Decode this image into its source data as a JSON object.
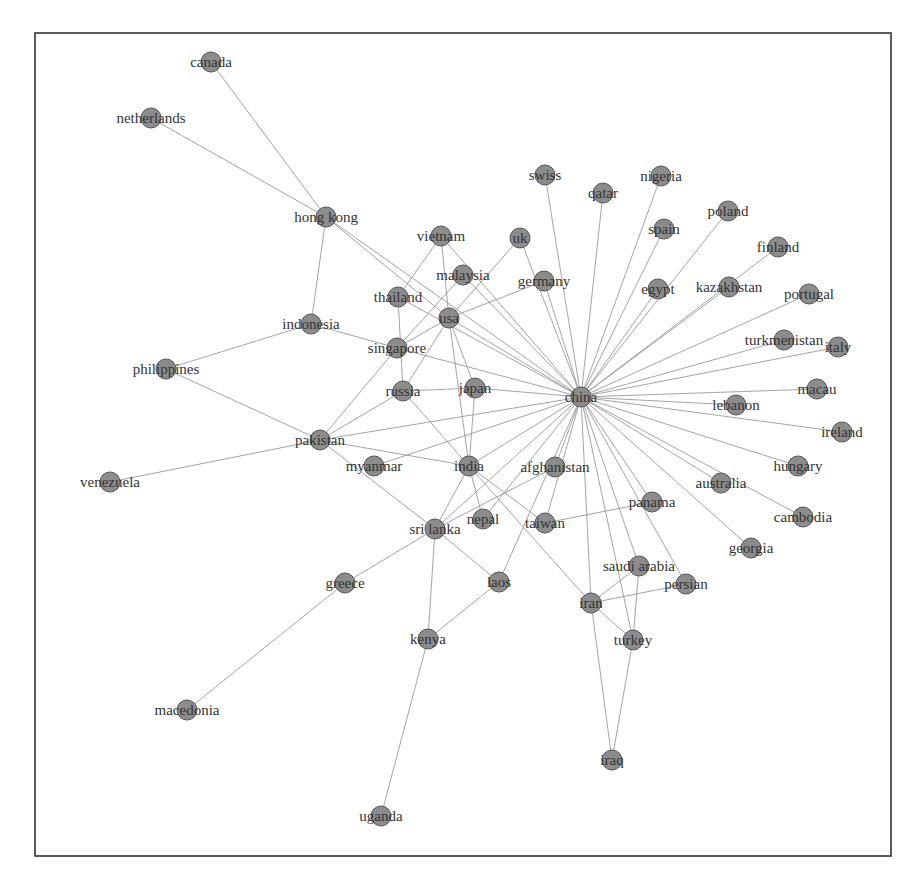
{
  "figure": {
    "type": "network-graph",
    "frame": {
      "x": 35,
      "y": 33,
      "width": 856,
      "height": 823
    },
    "colors": {
      "node_fill": "#8c8c8c",
      "node_stroke": "#555555",
      "edge": "#9a9a9a",
      "label": "#333333",
      "frame": "#333333"
    },
    "node_radius": 10
  },
  "nodes": [
    {
      "id": "canada",
      "label": "canada",
      "x": 211,
      "y": 62
    },
    {
      "id": "netherlands",
      "label": "netherlands",
      "x": 151,
      "y": 118
    },
    {
      "id": "hong_kong",
      "label": "hong kong",
      "x": 326,
      "y": 217
    },
    {
      "id": "vietnam",
      "label": "vietnam",
      "x": 441,
      "y": 236
    },
    {
      "id": "uk",
      "label": "uk",
      "x": 520,
      "y": 238
    },
    {
      "id": "swiss",
      "label": "swiss",
      "x": 545,
      "y": 175
    },
    {
      "id": "qatar",
      "label": "qatar",
      "x": 603,
      "y": 193
    },
    {
      "id": "nigeria",
      "label": "nigeria",
      "x": 661,
      "y": 176
    },
    {
      "id": "spain",
      "label": "spain",
      "x": 664,
      "y": 229
    },
    {
      "id": "poland",
      "label": "poland",
      "x": 728,
      "y": 211
    },
    {
      "id": "finland",
      "label": "finland",
      "x": 778,
      "y": 247
    },
    {
      "id": "egypt",
      "label": "egypt",
      "x": 658,
      "y": 289
    },
    {
      "id": "kazakhstan",
      "label": "kazakhstan",
      "x": 729,
      "y": 287
    },
    {
      "id": "portugal",
      "label": "portugal",
      "x": 809,
      "y": 294
    },
    {
      "id": "malaysia",
      "label": "malaysia",
      "x": 463,
      "y": 275
    },
    {
      "id": "germany",
      "label": "germany",
      "x": 544,
      "y": 281
    },
    {
      "id": "thailand",
      "label": "thailand",
      "x": 398,
      "y": 297
    },
    {
      "id": "usa",
      "label": "usa",
      "x": 449,
      "y": 318
    },
    {
      "id": "indonesia",
      "label": "indonesia",
      "x": 311,
      "y": 324
    },
    {
      "id": "singapore",
      "label": "singapore",
      "x": 397,
      "y": 348
    },
    {
      "id": "turkmenistan",
      "label": "turkmenistan",
      "x": 784,
      "y": 340
    },
    {
      "id": "italy",
      "label": "italy",
      "x": 838,
      "y": 347
    },
    {
      "id": "philippines",
      "label": "philippines",
      "x": 166,
      "y": 369
    },
    {
      "id": "russia",
      "label": "russia",
      "x": 403,
      "y": 391
    },
    {
      "id": "japan",
      "label": "japan",
      "x": 475,
      "y": 388
    },
    {
      "id": "china",
      "label": "china",
      "x": 581,
      "y": 397
    },
    {
      "id": "macau",
      "label": "macau",
      "x": 817,
      "y": 389
    },
    {
      "id": "lebanon",
      "label": "lebanon",
      "x": 736,
      "y": 405
    },
    {
      "id": "ireland",
      "label": "ireland",
      "x": 842,
      "y": 432
    },
    {
      "id": "pakistan",
      "label": "pakistan",
      "x": 320,
      "y": 440
    },
    {
      "id": "myanmar",
      "label": "myanmar",
      "x": 374,
      "y": 466
    },
    {
      "id": "india",
      "label": "india",
      "x": 469,
      "y": 466
    },
    {
      "id": "afghanistan",
      "label": "afghanistan",
      "x": 555,
      "y": 467
    },
    {
      "id": "hungary",
      "label": "hungary",
      "x": 798,
      "y": 466
    },
    {
      "id": "australia",
      "label": "australia",
      "x": 721,
      "y": 483
    },
    {
      "id": "panama",
      "label": "panama",
      "x": 652,
      "y": 502
    },
    {
      "id": "venezuela",
      "label": "venezuela",
      "x": 110,
      "y": 482
    },
    {
      "id": "cambodia",
      "label": "cambodia",
      "x": 803,
      "y": 517
    },
    {
      "id": "nepal",
      "label": "nepal",
      "x": 483,
      "y": 519
    },
    {
      "id": "taiwan",
      "label": "taiwan",
      "x": 545,
      "y": 523
    },
    {
      "id": "sri_lanka",
      "label": "sri lanka",
      "x": 435,
      "y": 529
    },
    {
      "id": "georgia",
      "label": "georgia",
      "x": 751,
      "y": 548
    },
    {
      "id": "saudi_arabia",
      "label": "saudi arabia",
      "x": 639,
      "y": 566
    },
    {
      "id": "persian",
      "label": "persian",
      "x": 686,
      "y": 584
    },
    {
      "id": "greece",
      "label": "greece",
      "x": 345,
      "y": 583
    },
    {
      "id": "laos",
      "label": "laos",
      "x": 499,
      "y": 582
    },
    {
      "id": "iran",
      "label": "iran",
      "x": 591,
      "y": 603
    },
    {
      "id": "kenya",
      "label": "kenya",
      "x": 428,
      "y": 639
    },
    {
      "id": "turkey",
      "label": "turkey",
      "x": 633,
      "y": 640
    },
    {
      "id": "macedonia",
      "label": "macedonia",
      "x": 187,
      "y": 710
    },
    {
      "id": "iraq",
      "label": "iraq",
      "x": 612,
      "y": 760
    },
    {
      "id": "uganda",
      "label": "uganda",
      "x": 381,
      "y": 816
    }
  ],
  "edges": [
    [
      "canada",
      "hong_kong"
    ],
    [
      "netherlands",
      "hong_kong"
    ],
    [
      "hong_kong",
      "indonesia"
    ],
    [
      "hong_kong",
      "usa"
    ],
    [
      "hong_kong",
      "china"
    ],
    [
      "indonesia",
      "singapore"
    ],
    [
      "indonesia",
      "philippines"
    ],
    [
      "philippines",
      "pakistan"
    ],
    [
      "venezuela",
      "pakistan"
    ],
    [
      "vietnam",
      "thailand"
    ],
    [
      "vietnam",
      "usa"
    ],
    [
      "vietnam",
      "china"
    ],
    [
      "malaysia",
      "singapore"
    ],
    [
      "malaysia",
      "china"
    ],
    [
      "uk",
      "usa"
    ],
    [
      "uk",
      "china"
    ],
    [
      "germany",
      "usa"
    ],
    [
      "germany",
      "china"
    ],
    [
      "swiss",
      "china"
    ],
    [
      "qatar",
      "china"
    ],
    [
      "nigeria",
      "china"
    ],
    [
      "spain",
      "china"
    ],
    [
      "poland",
      "china"
    ],
    [
      "finland",
      "china"
    ],
    [
      "egypt",
      "china"
    ],
    [
      "kazakhstan",
      "china"
    ],
    [
      "portugal",
      "china"
    ],
    [
      "turkmenistan",
      "china"
    ],
    [
      "italy",
      "china"
    ],
    [
      "macau",
      "china"
    ],
    [
      "lebanon",
      "china"
    ],
    [
      "ireland",
      "china"
    ],
    [
      "hungary",
      "china"
    ],
    [
      "australia",
      "china"
    ],
    [
      "cambodia",
      "china"
    ],
    [
      "georgia",
      "china"
    ],
    [
      "panama",
      "china"
    ],
    [
      "persian",
      "china"
    ],
    [
      "saudi_arabia",
      "china"
    ],
    [
      "turkey",
      "china"
    ],
    [
      "iran",
      "china"
    ],
    [
      "thailand",
      "russia"
    ],
    [
      "thailand",
      "china"
    ],
    [
      "usa",
      "singapore"
    ],
    [
      "usa",
      "russia"
    ],
    [
      "usa",
      "japan"
    ],
    [
      "usa",
      "india"
    ],
    [
      "usa",
      "china"
    ],
    [
      "singapore",
      "pakistan"
    ],
    [
      "singapore",
      "china"
    ],
    [
      "russia",
      "japan"
    ],
    [
      "russia",
      "pakistan"
    ],
    [
      "russia",
      "india"
    ],
    [
      "japan",
      "china"
    ],
    [
      "japan",
      "india"
    ],
    [
      "pakistan",
      "china"
    ],
    [
      "pakistan",
      "india"
    ],
    [
      "pakistan",
      "sri_lanka"
    ],
    [
      "myanmar",
      "china"
    ],
    [
      "india",
      "china"
    ],
    [
      "india",
      "nepal"
    ],
    [
      "india",
      "sri_lanka"
    ],
    [
      "india",
      "taiwan"
    ],
    [
      "india",
      "iran"
    ],
    [
      "afghanistan",
      "china"
    ],
    [
      "afghanistan",
      "sri_lanka"
    ],
    [
      "nepal",
      "china"
    ],
    [
      "taiwan",
      "china"
    ],
    [
      "taiwan",
      "panama"
    ],
    [
      "sri_lanka",
      "china"
    ],
    [
      "sri_lanka",
      "greece"
    ],
    [
      "sri_lanka",
      "kenya"
    ],
    [
      "sri_lanka",
      "laos"
    ],
    [
      "laos",
      "china"
    ],
    [
      "laos",
      "kenya"
    ],
    [
      "greece",
      "macedonia"
    ],
    [
      "kenya",
      "uganda"
    ],
    [
      "iran",
      "saudi_arabia"
    ],
    [
      "iran",
      "persian"
    ],
    [
      "iran",
      "turkey"
    ],
    [
      "iran",
      "iraq"
    ],
    [
      "turkey",
      "iraq"
    ],
    [
      "saudi_arabia",
      "turkey"
    ]
  ]
}
